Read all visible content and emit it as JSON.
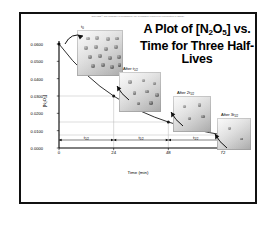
{
  "figure": {
    "copyright": "Copyright © The McGraw-Hill Companies, Inc. Permission required for reproduction or display.",
    "title_line1": "A Plot of [N",
    "title_sub1": "2",
    "title_mid": "O",
    "title_sub2": "5",
    "title_line1_end": "] vs.",
    "title_line2": "Time for Three Half-",
    "title_line3": "Lives"
  },
  "chart_data": {
    "type": "line",
    "xlabel": "Time (min)",
    "ylabel": "[N2O5]",
    "xlim": [
      0,
      72
    ],
    "ylim": [
      0.0,
      0.06
    ],
    "grid": true,
    "legend_position": "none",
    "x_ticks": [
      "0",
      "24",
      "48",
      "72"
    ],
    "x_tick_values": [
      0,
      24,
      48,
      72
    ],
    "y_ticks": [
      "0.0000",
      "0.0100",
      "0.0200",
      "0.0300",
      "0.0400",
      "0.0500",
      "0.0600"
    ],
    "y_tick_values": [
      0.0,
      0.01,
      0.02,
      0.03,
      0.04,
      0.05,
      0.06
    ],
    "series": [
      {
        "name": "[N2O5]",
        "x": [
          0,
          6,
          12,
          18,
          24,
          30,
          36,
          42,
          48,
          54,
          60,
          66,
          72
        ],
        "values": [
          0.06,
          0.0504,
          0.0424,
          0.0356,
          0.03,
          0.0252,
          0.0212,
          0.0178,
          0.015,
          0.0126,
          0.0106,
          0.0089,
          0.0075
        ]
      }
    ],
    "markers": [
      {
        "x": 0,
        "y": 0.06,
        "label": "t0"
      },
      {
        "x": 24,
        "y": 0.03,
        "label": "after 1 half-life"
      },
      {
        "x": 48,
        "y": 0.015,
        "label": "after 2 half-lives"
      },
      {
        "x": 72,
        "y": 0.0075,
        "label": "after 3 half-lives"
      }
    ],
    "annotations": [
      {
        "name": "half-life-1",
        "from": 0,
        "to": 24,
        "label": "t1/2"
      },
      {
        "name": "half-life-2",
        "from": 24,
        "to": 48,
        "label": "t1/2"
      },
      {
        "name": "half-life-3",
        "from": 48,
        "to": 72,
        "label": "t1/2"
      }
    ]
  },
  "half_life_labels": [
    {
      "text": "t",
      "sub": "1/2"
    },
    {
      "text": "t",
      "sub": "1/2"
    },
    {
      "text": "t",
      "sub": "1/2"
    }
  ],
  "boxes": [
    {
      "name": "box-t0",
      "caption": "t",
      "caption_sub": "0",
      "particles": 16
    },
    {
      "name": "box-t-half",
      "caption": "After t",
      "caption_sub": "1/2",
      "particles": 8
    },
    {
      "name": "box-2t-half",
      "caption": "After 2t",
      "caption_sub": "1/2",
      "particles": 4
    },
    {
      "name": "box-3t-half",
      "caption": "After 3t",
      "caption_sub": "1/2",
      "particles": 2
    }
  ],
  "colors": {
    "frame": "#111111",
    "curve": "#1a1a1a",
    "grid": "#b8b8b8",
    "axis": "#000000",
    "text": "#000000"
  }
}
